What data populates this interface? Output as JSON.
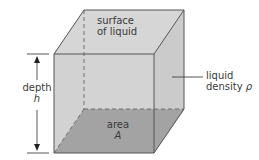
{
  "diagram": {
    "labels": {
      "surface_line1": "surface",
      "surface_line2": "of liquid",
      "depth_word": "depth",
      "depth_symbol": "h",
      "density_word1": "liquid",
      "density_word2": "density",
      "density_symbol": "ρ",
      "area_word": "area",
      "area_symbol": "A"
    },
    "colors": {
      "top_face": "#d6d6d6",
      "front_face": "#d2d2d2",
      "side_face": "#cbcbcb",
      "bottom_face": "#a3a3a3",
      "edge": "#555555",
      "dashed_edge": "#666666",
      "text": "#3a3a3a",
      "background": "#ffffff"
    }
  }
}
